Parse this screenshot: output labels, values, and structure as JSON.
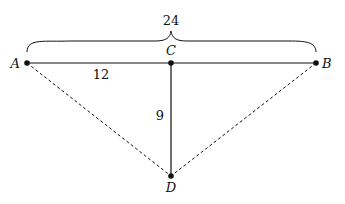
{
  "diagram": {
    "type": "geometry",
    "points": [
      {
        "id": "A",
        "label": "A",
        "x": 27,
        "y": 63
      },
      {
        "id": "B",
        "label": "B",
        "x": 316,
        "y": 63
      },
      {
        "id": "C",
        "label": "C",
        "x": 171,
        "y": 63
      },
      {
        "id": "D",
        "label": "D",
        "x": 171,
        "y": 176
      }
    ],
    "segments": [
      {
        "from": "A",
        "to": "B",
        "style": "solid"
      },
      {
        "from": "C",
        "to": "D",
        "style": "solid"
      },
      {
        "from": "A",
        "to": "D",
        "style": "dashed"
      },
      {
        "from": "B",
        "to": "D",
        "style": "dashed"
      }
    ],
    "measurements": {
      "AB": "24",
      "AC": "12",
      "CD": "9"
    },
    "labels": {
      "A": "A",
      "B": "B",
      "C": "C",
      "D": "D",
      "brace_label": "24",
      "ac_length": "12",
      "cd_length": "9"
    },
    "colors": {
      "stroke": "#111111",
      "background": "#ffffff"
    }
  }
}
